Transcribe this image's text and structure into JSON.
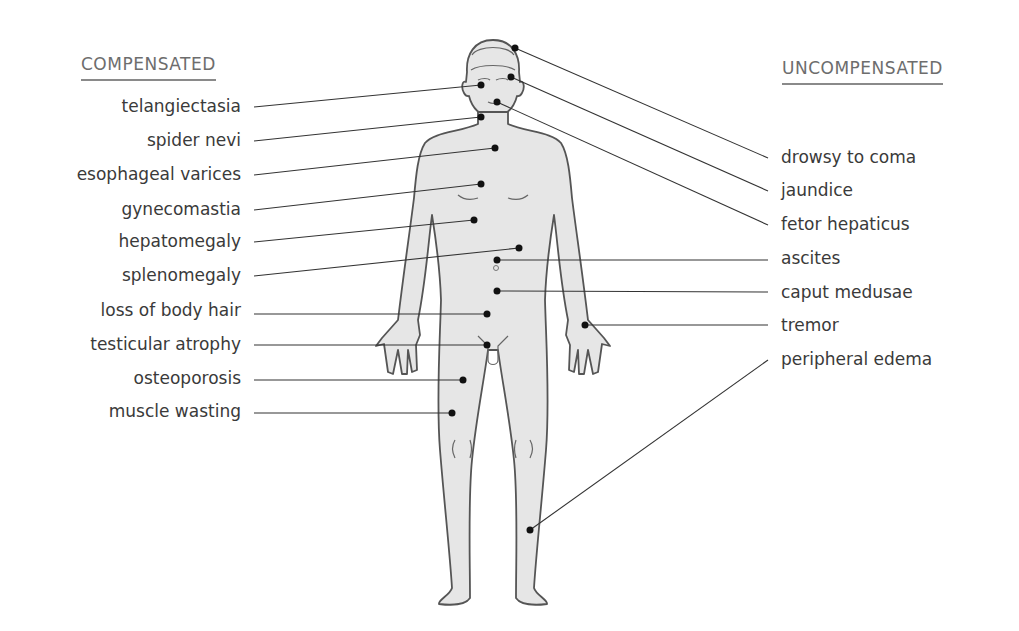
{
  "diagram": {
    "left_heading": "COMPENSATED",
    "right_heading": "UNCOMPENSATED",
    "compensated": [
      {
        "label": "telangiectasia",
        "y": 107
      },
      {
        "label": "spider nevi",
        "y": 141
      },
      {
        "label": "esophageal varices",
        "y": 175
      },
      {
        "label": "gynecomastia",
        "y": 210
      },
      {
        "label": "hepatomegaly",
        "y": 242
      },
      {
        "label": "splenomegaly",
        "y": 276
      },
      {
        "label": "loss of body hair",
        "y": 311
      },
      {
        "label": "testicular atrophy",
        "y": 345
      },
      {
        "label": "osteoporosis",
        "y": 379
      },
      {
        "label": "muscle wasting",
        "y": 412
      }
    ],
    "uncompensated": [
      {
        "label": "drowsy to coma",
        "y": 158
      },
      {
        "label": "jaundice",
        "y": 191
      },
      {
        "label": "fetor hepaticus",
        "y": 225
      },
      {
        "label": "ascites",
        "y": 259
      },
      {
        "label": "caput medusae",
        "y": 293
      },
      {
        "label": "tremor",
        "y": 326
      },
      {
        "label": "peripheral edema",
        "y": 360
      }
    ],
    "colors": {
      "body_fill": "#e6e6e6",
      "body_outline": "#555555",
      "heading": "#6d6d6d",
      "label_text": "#3a3a3a",
      "leader_line": "#333333",
      "dot": "#111111"
    }
  }
}
